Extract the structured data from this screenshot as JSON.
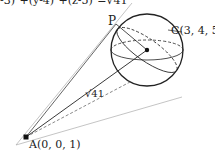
{
  "header_fragment": "-3)²+(y-4)²+(z-5)²=√41",
  "points": {
    "A": {
      "label": "A(0, 0, 1)",
      "x": 26,
      "y": 137
    },
    "C": {
      "label": "C(3, 4, 5)",
      "x": 147,
      "y": 50
    },
    "P": {
      "label": "P",
      "x": 116,
      "y": 24
    }
  },
  "segment_label": "√41",
  "sphere": {
    "cx": 147,
    "cy": 50,
    "r": 36
  },
  "colors": {
    "stroke": "#222222",
    "tangent": "#999999"
  }
}
